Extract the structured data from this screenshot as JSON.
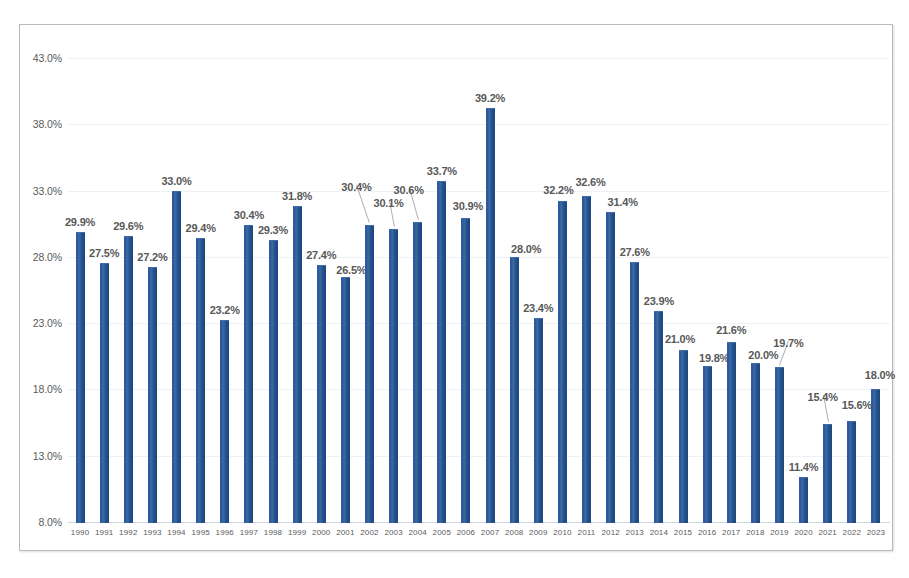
{
  "chart_data": {
    "type": "bar",
    "title": "",
    "subtitle": "",
    "xlabel": "",
    "ylabel": "",
    "ylim": [
      8.0,
      43.0
    ],
    "ytick_labels": [
      "43.0%",
      "38.0%",
      "33.0%",
      "28.0%",
      "23.0%",
      "18.0%",
      "13.0%",
      "8.0%"
    ],
    "ytick_values": [
      43.0,
      38.0,
      33.0,
      28.0,
      23.0,
      18.0,
      13.0,
      8.0
    ],
    "grid": true,
    "legend": "none",
    "series_color": "#2b5aa0",
    "value_label_suffix": "%",
    "categories": [
      "1990",
      "1991",
      "1992",
      "1993",
      "1994",
      "1995",
      "1996",
      "1997",
      "1998",
      "1999",
      "2000",
      "2001",
      "2002",
      "2003",
      "2004",
      "2005",
      "2006",
      "2007",
      "2008",
      "2009",
      "2010",
      "2011",
      "2012",
      "2013",
      "2014",
      "2015",
      "2016",
      "2017",
      "2018",
      "2019",
      "2020",
      "2021",
      "2022",
      "2023"
    ],
    "values": [
      29.9,
      27.5,
      29.6,
      27.2,
      33.0,
      29.4,
      23.2,
      30.4,
      29.3,
      31.8,
      27.4,
      26.5,
      30.4,
      30.1,
      30.6,
      33.7,
      30.9,
      39.2,
      28.0,
      23.4,
      32.2,
      32.6,
      31.4,
      27.6,
      23.9,
      21.0,
      19.8,
      21.6,
      20.0,
      19.7,
      11.4,
      15.4,
      15.6,
      18.0
    ],
    "data_labels": [
      "29.9%",
      "27.5%",
      "29.6%",
      "27.2%",
      "33.0%",
      "29.4%",
      "23.2%",
      "30.4%",
      "29.3%",
      "31.8%",
      "27.4%",
      "26.5%",
      "30.4%",
      "30.1%",
      "30.6%",
      "33.7%",
      "30.9%",
      "39.2%",
      "28.0%",
      "23.4%",
      "32.2%",
      "32.6%",
      "31.4%",
      "27.6%",
      "23.9%",
      "21.0%",
      "19.8%",
      "21.6%",
      "20.0%",
      "19.7%",
      "11.4%",
      "15.4%",
      "15.6%",
      "18.0%"
    ],
    "label_offsets_px": [
      {
        "dx": 0,
        "dy": -16,
        "leader": false
      },
      {
        "dx": 0,
        "dy": -16,
        "leader": false
      },
      {
        "dx": 0,
        "dy": -16,
        "leader": false
      },
      {
        "dx": 0,
        "dy": -16,
        "leader": false
      },
      {
        "dx": 0,
        "dy": -16,
        "leader": false
      },
      {
        "dx": 0,
        "dy": -16,
        "leader": false
      },
      {
        "dx": 0,
        "dy": -16,
        "leader": false
      },
      {
        "dx": 0,
        "dy": -16,
        "leader": false
      },
      {
        "dx": 0,
        "dy": -16,
        "leader": false
      },
      {
        "dx": 0,
        "dy": -16,
        "leader": false
      },
      {
        "dx": 0,
        "dy": -16,
        "leader": false
      },
      {
        "dx": 6,
        "dy": -13,
        "leader": false
      },
      {
        "dx": -13,
        "dy": -44,
        "leader": true
      },
      {
        "dx": -5,
        "dy": -32,
        "leader": true
      },
      {
        "dx": -9,
        "dy": -38,
        "leader": true
      },
      {
        "dx": 0,
        "dy": -16,
        "leader": false
      },
      {
        "dx": 2,
        "dy": -18,
        "leader": false
      },
      {
        "dx": 0,
        "dy": -16,
        "leader": false
      },
      {
        "dx": 12,
        "dy": -14,
        "leader": false
      },
      {
        "dx": 0,
        "dy": -16,
        "leader": false
      },
      {
        "dx": -4,
        "dy": -17,
        "leader": false
      },
      {
        "dx": 4,
        "dy": -20,
        "leader": false
      },
      {
        "dx": 12,
        "dy": -16,
        "leader": false
      },
      {
        "dx": 0,
        "dy": -16,
        "leader": false
      },
      {
        "dx": 0,
        "dy": -16,
        "leader": false
      },
      {
        "dx": -3,
        "dy": -17,
        "leader": false
      },
      {
        "dx": 7,
        "dy": -14,
        "leader": false
      },
      {
        "dx": 0,
        "dy": -18,
        "leader": false
      },
      {
        "dx": 8,
        "dy": -14,
        "leader": false
      },
      {
        "dx": 9,
        "dy": -30,
        "leader": true
      },
      {
        "dx": 0,
        "dy": -16,
        "leader": false
      },
      {
        "dx": -5,
        "dy": -33,
        "leader": true
      },
      {
        "dx": 5,
        "dy": -22,
        "leader": false
      },
      {
        "dx": 4,
        "dy": -20,
        "leader": false
      }
    ]
  },
  "footnote": {
    "text": ""
  }
}
